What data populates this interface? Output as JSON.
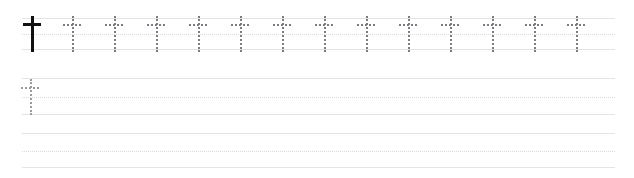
{
  "worksheet": {
    "title": "Handwriting Practice Worksheet",
    "glyph_name": "dagger",
    "glyph_character": "†",
    "page_background": "#ffffff",
    "rule_color": "#e3e4e6",
    "midline_color": "#d9dadc",
    "solid_glyph_color": "#111111",
    "trace_glyph_color": "#7b7d82",
    "faint_trace_glyph_color": "#9a9ca0",
    "line_left": 22,
    "line_right": 615,
    "glyph_spacing": 42,
    "rows": [
      {
        "row_label": "row-1",
        "top_rule_y": 18,
        "midline_y": 34,
        "baseline_y": 50,
        "model_glyph": {
          "style": "solid",
          "x": 32
        },
        "trace_glyph_count": 13,
        "trace_start_x": 72,
        "trace_style": "trace"
      },
      {
        "row_label": "row-2",
        "top_rule_y": 78,
        "midline_y": 97,
        "baseline_y": 115,
        "model_glyph": null,
        "trace_glyph_count": 1,
        "trace_start_x": 30,
        "trace_style": "faint"
      },
      {
        "row_label": "row-3",
        "top_rule_y": 133,
        "midline_y": 152,
        "baseline_y": 168,
        "model_glyph": null,
        "trace_glyph_count": 0,
        "trace_start_x": 30,
        "trace_style": "faint"
      }
    ]
  }
}
